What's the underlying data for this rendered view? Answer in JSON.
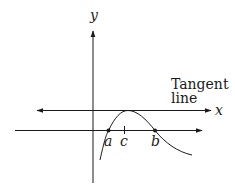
{
  "diagram": {
    "type": "mean-value / Rolle's theorem illustration",
    "axis_labels": {
      "y": "y",
      "x": "x"
    },
    "tangent_label_line1": "Tangent",
    "tangent_label_line2": "line",
    "points": [
      {
        "id": "a",
        "label": "a",
        "marked": true
      },
      {
        "id": "c",
        "label": "c",
        "marked": false,
        "tick": true
      },
      {
        "id": "b",
        "label": "b",
        "marked": true
      }
    ],
    "colors": {
      "stroke": "#1a1a1a",
      "background": "#ffffff"
    }
  }
}
